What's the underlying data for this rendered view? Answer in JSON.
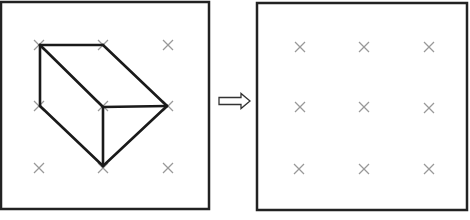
{
  "diagram": {
    "colors": {
      "frame": "#222222",
      "shape_stroke": "#1a1a1a",
      "grid_marker": "#999999",
      "arrow_stroke": "#333333",
      "background": "#ffffff"
    },
    "left_panel": {
      "frame": {
        "x": 1,
        "y": 2,
        "w": 208,
        "h": 207
      },
      "grid_points": [
        [
          39,
          45
        ],
        [
          103,
          45
        ],
        [
          168,
          45
        ],
        [
          39,
          106
        ],
        [
          103,
          106
        ],
        [
          168,
          106
        ],
        [
          39,
          168
        ],
        [
          103,
          168
        ],
        [
          168,
          168
        ]
      ],
      "shape_edges": [
        [
          [
            40,
            45
          ],
          [
            103,
            45
          ]
        ],
        [
          [
            40,
            45
          ],
          [
            40,
            106
          ]
        ],
        [
          [
            40,
            45
          ],
          [
            103,
            107
          ]
        ],
        [
          [
            103,
            45
          ],
          [
            167,
            106
          ]
        ],
        [
          [
            103,
            107
          ],
          [
            167,
            106
          ]
        ],
        [
          [
            103,
            107
          ],
          [
            103,
            166
          ]
        ],
        [
          [
            40,
            106
          ],
          [
            103,
            166
          ]
        ],
        [
          [
            167,
            106
          ],
          [
            103,
            166
          ]
        ]
      ]
    },
    "arrow": {
      "direction": "right",
      "style": "hollow",
      "x1": 219,
      "x2": 250,
      "y": 101
    },
    "right_panel": {
      "frame": {
        "x": 257,
        "y": 3,
        "w": 210,
        "h": 207
      },
      "grid_points": [
        [
          300,
          47
        ],
        [
          364,
          47
        ],
        [
          429,
          47
        ],
        [
          300,
          107
        ],
        [
          364,
          107
        ],
        [
          429,
          108
        ],
        [
          299,
          169
        ],
        [
          364,
          169
        ],
        [
          429,
          169
        ]
      ]
    }
  }
}
